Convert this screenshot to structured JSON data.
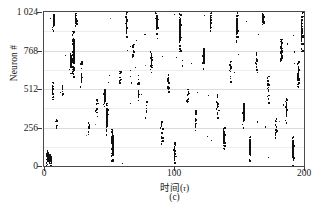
{
  "figure": {
    "caption": "(c)",
    "type": "spike-raster-plot"
  },
  "axes": {
    "y_title": "Neuron #",
    "x_title_prefix": "时间(",
    "x_title_symbol": "τ",
    "x_title_suffix": ")",
    "y_ticks": [
      "0",
      "256",
      "512",
      "768",
      "1 024"
    ],
    "x_ticks": [
      "0",
      "100",
      "200"
    ]
  },
  "colors": {
    "spike": "#111111",
    "frame": "#4a4a4a",
    "grid": "#dcdcdc",
    "background": "#ffffff",
    "text": "#1a1a1a"
  },
  "chart_data": {
    "type": "scatter",
    "title": "",
    "subtitle": "(c)",
    "xlabel": "时间(τ)",
    "ylabel": "Neuron #",
    "xlim": [
      0,
      200
    ],
    "ylim": [
      0,
      1024
    ],
    "xticks": [
      0,
      100,
      200
    ],
    "yticks": [
      0,
      256,
      512,
      768,
      1024
    ],
    "grid": "horizontal",
    "legend": "none",
    "marker": "square-dot",
    "bursts": [
      {
        "t": 2,
        "n_low": 0,
        "n_high": 110,
        "density": 0.95
      },
      {
        "t": 3.5,
        "n_low": 0,
        "n_high": 95,
        "density": 0.9
      },
      {
        "t": 5,
        "n_low": 0,
        "n_high": 80,
        "density": 0.85
      },
      {
        "t": 6.5,
        "n_low": 440,
        "n_high": 560,
        "density": 0.8
      },
      {
        "t": 7,
        "n_low": 900,
        "n_high": 1024,
        "density": 0.92
      },
      {
        "t": 9,
        "n_low": 240,
        "n_high": 310,
        "density": 0.7
      },
      {
        "t": 14,
        "n_low": 470,
        "n_high": 540,
        "density": 0.75
      },
      {
        "t": 20,
        "n_low": 620,
        "n_high": 760,
        "density": 0.85
      },
      {
        "t": 22,
        "n_low": 600,
        "n_high": 900,
        "density": 0.9
      },
      {
        "t": 24,
        "n_low": 930,
        "n_high": 1024,
        "density": 0.8
      },
      {
        "t": 28,
        "n_low": 520,
        "n_high": 700,
        "density": 0.7
      },
      {
        "t": 34,
        "n_low": 200,
        "n_high": 300,
        "density": 0.65
      },
      {
        "t": 40,
        "n_low": 330,
        "n_high": 470,
        "density": 0.7
      },
      {
        "t": 46,
        "n_low": 390,
        "n_high": 520,
        "density": 0.85
      },
      {
        "t": 48,
        "n_low": 200,
        "n_high": 420,
        "density": 0.9
      },
      {
        "t": 52,
        "n_low": 0,
        "n_high": 250,
        "density": 0.8
      },
      {
        "t": 58,
        "n_low": 540,
        "n_high": 640,
        "density": 0.7
      },
      {
        "t": 63,
        "n_low": 860,
        "n_high": 1024,
        "density": 0.85
      },
      {
        "t": 68,
        "n_low": 700,
        "n_high": 820,
        "density": 0.75
      },
      {
        "t": 72,
        "n_low": 430,
        "n_high": 560,
        "density": 0.7
      },
      {
        "t": 78,
        "n_low": 320,
        "n_high": 440,
        "density": 0.65
      },
      {
        "t": 82,
        "n_low": 620,
        "n_high": 780,
        "density": 0.8
      },
      {
        "t": 86,
        "n_low": 880,
        "n_high": 1024,
        "density": 0.9
      },
      {
        "t": 90,
        "n_low": 140,
        "n_high": 300,
        "density": 0.7
      },
      {
        "t": 95,
        "n_low": 500,
        "n_high": 650,
        "density": 0.75
      },
      {
        "t": 100,
        "n_low": 0,
        "n_high": 160,
        "density": 0.85
      },
      {
        "t": 104,
        "n_low": 760,
        "n_high": 1024,
        "density": 0.8
      },
      {
        "t": 110,
        "n_low": 400,
        "n_high": 530,
        "density": 0.7
      },
      {
        "t": 116,
        "n_low": 230,
        "n_high": 380,
        "density": 0.75
      },
      {
        "t": 122,
        "n_low": 640,
        "n_high": 790,
        "density": 0.8
      },
      {
        "t": 128,
        "n_low": 900,
        "n_high": 1024,
        "density": 0.85
      },
      {
        "t": 133,
        "n_low": 300,
        "n_high": 480,
        "density": 0.7
      },
      {
        "t": 138,
        "n_low": 110,
        "n_high": 260,
        "density": 0.8
      },
      {
        "t": 143,
        "n_low": 560,
        "n_high": 700,
        "density": 0.75
      },
      {
        "t": 148,
        "n_low": 820,
        "n_high": 1024,
        "density": 0.8
      },
      {
        "t": 153,
        "n_low": 250,
        "n_high": 420,
        "density": 0.85
      },
      {
        "t": 158,
        "n_low": 40,
        "n_high": 200,
        "density": 0.8
      },
      {
        "t": 163,
        "n_low": 620,
        "n_high": 760,
        "density": 0.7
      },
      {
        "t": 168,
        "n_low": 940,
        "n_high": 1024,
        "density": 0.8
      },
      {
        "t": 172,
        "n_low": 420,
        "n_high": 600,
        "density": 0.75
      },
      {
        "t": 178,
        "n_low": 180,
        "n_high": 320,
        "density": 0.7
      },
      {
        "t": 182,
        "n_low": 700,
        "n_high": 860,
        "density": 0.8
      },
      {
        "t": 186,
        "n_low": 280,
        "n_high": 460,
        "density": 0.85
      },
      {
        "t": 191,
        "n_low": 0,
        "n_high": 200,
        "density": 0.9
      },
      {
        "t": 195,
        "n_low": 520,
        "n_high": 700,
        "density": 0.8
      },
      {
        "t": 198,
        "n_low": 760,
        "n_high": 1024,
        "density": 0.85
      }
    ],
    "sparse_point_count": 520
  }
}
